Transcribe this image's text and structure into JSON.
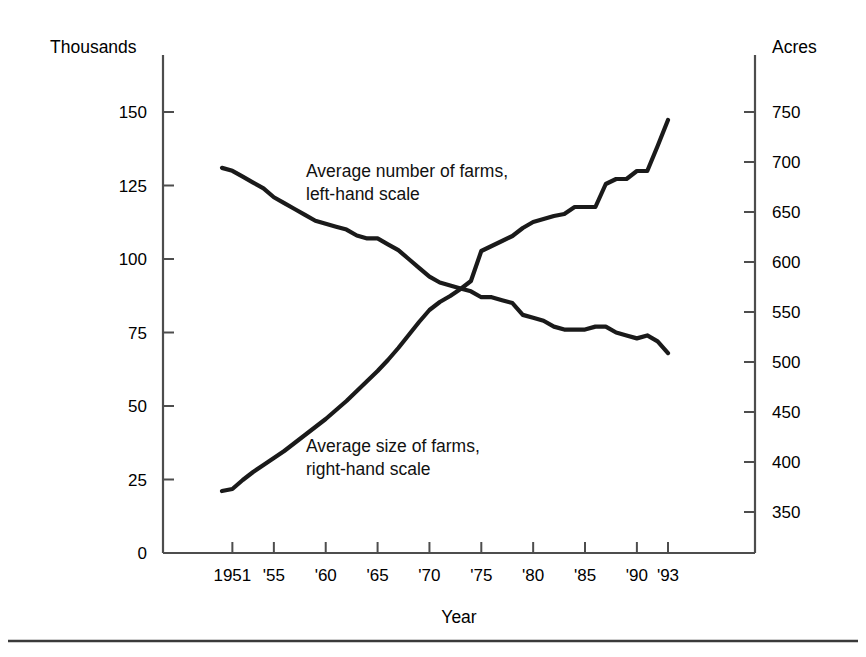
{
  "figure": {
    "background_color": "#ffffff",
    "line_color": "#1a1a1a",
    "axis_color": "#4d4d4d",
    "bottom_rule_color": "#3a3a3a"
  },
  "chart_data": {
    "type": "line",
    "title": "",
    "subtitle": "",
    "xlabel": "Year",
    "left_axis_title": "Thousands",
    "right_axis_title": "Acres",
    "grid": false,
    "legend_position": "inline-annotations",
    "x": [
      1950,
      1951,
      1952,
      1953,
      1954,
      1955,
      1956,
      1957,
      1958,
      1959,
      1960,
      1961,
      1962,
      1963,
      1964,
      1965,
      1966,
      1967,
      1968,
      1969,
      1970,
      1971,
      1972,
      1973,
      1974,
      1975,
      1976,
      1977,
      1978,
      1979,
      1980,
      1981,
      1982,
      1983,
      1984,
      1985,
      1986,
      1987,
      1988,
      1989,
      1990,
      1991,
      1992,
      1993
    ],
    "xtick_values": [
      1951,
      1955,
      1960,
      1965,
      1970,
      1975,
      1980,
      1985,
      1990,
      1993
    ],
    "xtick_labels": [
      "1951",
      "'55",
      "'60",
      "'65",
      "'70",
      "'75",
      "'80",
      "'85",
      "'90",
      "'93"
    ],
    "xlim": [
      1950,
      1993
    ],
    "series": [
      {
        "name": "Average number of farms, left-hand scale",
        "axis": "left",
        "ylabel": "Thousands",
        "ylim": [
          0,
          155
        ],
        "ytick_values": [
          0,
          25,
          50,
          75,
          100,
          125,
          150
        ],
        "ytick_labels": [
          "0",
          "25",
          "50",
          "75",
          "100",
          "125",
          "150"
        ],
        "annotation": {
          "line1": "Average number of farms,",
          "line2": "left-hand scale"
        },
        "values": [
          131,
          130,
          128,
          126,
          124,
          121,
          119,
          117,
          115,
          113,
          112,
          111,
          110,
          108,
          107,
          107,
          105,
          103,
          100,
          97,
          94,
          92,
          91,
          90,
          89,
          87,
          87,
          86,
          85,
          81,
          80,
          79,
          77,
          76,
          76,
          76,
          77,
          77,
          75,
          74,
          73,
          74,
          72,
          68
        ]
      },
      {
        "name": "Average size of farms, right-hand scale",
        "axis": "right",
        "ylabel": "Acres",
        "ylim": [
          337,
          760
        ],
        "ytick_values": [
          350,
          400,
          450,
          500,
          550,
          600,
          650,
          700,
          750
        ],
        "ytick_labels": [
          "350",
          "400",
          "450",
          "500",
          "550",
          "600",
          "650",
          "700",
          "750"
        ],
        "annotation": {
          "line1": "Average size of farms,",
          "line2": "right-hand scale"
        },
        "values": [
          371,
          373,
          382,
          390,
          397,
          404,
          411,
          419,
          427,
          435,
          443,
          452,
          461,
          471,
          481,
          491,
          502,
          514,
          527,
          540,
          552,
          560,
          566,
          573,
          581,
          611,
          616,
          621,
          626,
          634,
          640,
          643,
          646,
          648,
          655,
          655,
          655,
          678,
          683,
          683,
          691,
          691,
          716,
          742
        ]
      }
    ]
  },
  "axes": {
    "left_title": "Thousands",
    "right_title": "Acres",
    "x_title": "Year"
  }
}
